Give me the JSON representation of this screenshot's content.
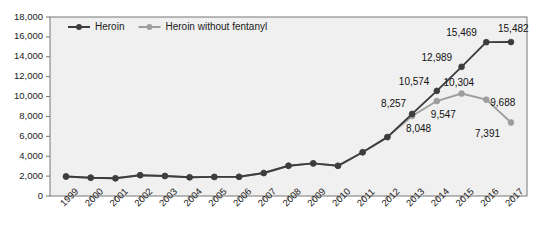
{
  "chart_data": {
    "type": "line",
    "title": "",
    "subtitle": "",
    "xlabel": "",
    "ylabel": "",
    "grid": false,
    "legend_position": "top-left",
    "plot_background": "#f0f0f0",
    "categories": [
      "1999",
      "2000",
      "2001",
      "2002",
      "2003",
      "2004",
      "2005",
      "2006",
      "2007",
      "2008",
      "2009",
      "2010",
      "2011",
      "2012",
      "2013",
      "2014",
      "2015",
      "2016",
      "2017"
    ],
    "x": [
      1999,
      2000,
      2001,
      2002,
      2003,
      2004,
      2005,
      2006,
      2007,
      2008,
      2009,
      2010,
      2011,
      2012,
      2013,
      2014,
      2015,
      2016,
      2017
    ],
    "ylim": [
      0,
      18000
    ],
    "yticks": [
      0,
      2000,
      4000,
      6000,
      8000,
      10000,
      12000,
      14000,
      16000,
      18000
    ],
    "ytick_labels": [
      "0",
      "2,000",
      "4,000",
      "6,000",
      "8,000",
      "10,000",
      "12,000",
      "14,000",
      "16,000",
      "18,000"
    ],
    "series": [
      {
        "name": "Heroin",
        "color": "#3d3d3d",
        "marker": "circle",
        "values": [
          1960,
          1840,
          1780,
          2090,
          2010,
          1880,
          1920,
          1930,
          2310,
          3040,
          3280,
          3036,
          4397,
          5925,
          8257,
          10574,
          12989,
          15469,
          15482
        ],
        "labels": {
          "2013": "8,257",
          "2014": "10,574",
          "2015": "12,989",
          "2016": "15,469",
          "2017": "15,482"
        }
      },
      {
        "name": "Heroin without fentanyl",
        "color": "#9d9d9d",
        "marker": "circle",
        "values": [
          1960,
          1840,
          1780,
          2090,
          2010,
          1880,
          1920,
          1930,
          2310,
          3040,
          3280,
          3036,
          4397,
          5925,
          8048,
          9547,
          10304,
          9688,
          7391
        ],
        "labels": {
          "2013": "8,048",
          "2014": "9,547",
          "2015": "10,304",
          "2016": "9,688",
          "2017": "7,391"
        }
      }
    ],
    "annotations": [
      {
        "text": "8,257",
        "series": "Heroin",
        "year": "2013"
      },
      {
        "text": "10,574",
        "series": "Heroin",
        "year": "2014"
      },
      {
        "text": "12,989",
        "series": "Heroin",
        "year": "2015"
      },
      {
        "text": "15,469",
        "series": "Heroin",
        "year": "2016"
      },
      {
        "text": "15,482",
        "series": "Heroin",
        "year": "2017"
      },
      {
        "text": "8,048",
        "series": "Heroin without fentanyl",
        "year": "2013"
      },
      {
        "text": "9,547",
        "series": "Heroin without fentanyl",
        "year": "2014"
      },
      {
        "text": "10,304",
        "series": "Heroin without fentanyl",
        "year": "2015"
      },
      {
        "text": "9,688",
        "series": "Heroin without fentanyl",
        "year": "2016"
      },
      {
        "text": "7,391",
        "series": "Heroin without fentanyl",
        "year": "2017"
      }
    ]
  },
  "legend": {
    "items": [
      {
        "label": "Heroin",
        "color": "#3d3d3d"
      },
      {
        "label": "Heroin without fentanyl",
        "color": "#9d9d9d"
      }
    ]
  },
  "axis_labels": {
    "y": [
      "18,000",
      "16,000",
      "14,000",
      "12,000",
      "10,000",
      "8,000",
      "6,000",
      "4,000",
      "2,000",
      "0"
    ],
    "x": [
      "1999",
      "2000",
      "2001",
      "2002",
      "2003",
      "2004",
      "2005",
      "2006",
      "2007",
      "2008",
      "2009",
      "2010",
      "2011",
      "2012",
      "2013",
      "2014",
      "2015",
      "2016",
      "2017"
    ]
  },
  "data_labels": {
    "dark_2013": "8,257",
    "dark_2014": "10,574",
    "dark_2015": "12,989",
    "dark_2016": "15,469",
    "dark_2017": "15,482",
    "gray_2013": "8,048",
    "gray_2014": "9,547",
    "gray_2015": "10,304",
    "gray_2016": "9,688",
    "gray_2017": "7,391"
  }
}
